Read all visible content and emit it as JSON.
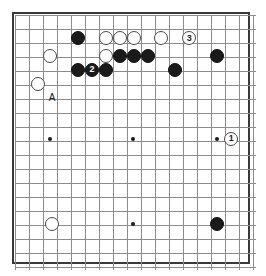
{
  "diagram": {
    "board": {
      "columns": 18,
      "rows": 19,
      "cell_size": 14,
      "origin_x": 15,
      "origin_y": 15,
      "line_color": "#8c8c8c",
      "border_color": "#3a3a3a",
      "background_color": "#ffffff"
    },
    "star_points": [
      {
        "name": "star-point-left",
        "col": 2.5,
        "row": 8.85
      },
      {
        "name": "star-point-center-upper",
        "col": 8.45,
        "row": 8.85
      },
      {
        "name": "star-point-right",
        "col": 14.45,
        "row": 8.85
      },
      {
        "name": "star-point-center-lower",
        "col": 8.45,
        "row": 14.9
      }
    ],
    "stone_radius": 7,
    "stones": [
      {
        "id": "b1",
        "color": "black",
        "label": "",
        "col": 4.5,
        "row": 1.65
      },
      {
        "id": "w1",
        "color": "white",
        "label": "",
        "col": 6.5,
        "row": 1.65
      },
      {
        "id": "w2",
        "color": "white",
        "label": "",
        "col": 7.5,
        "row": 1.65
      },
      {
        "id": "w3",
        "color": "white",
        "label": "",
        "col": 8.5,
        "row": 1.65
      },
      {
        "id": "w4",
        "color": "white",
        "label": "",
        "col": 10.45,
        "row": 1.65
      },
      {
        "id": "w5",
        "color": "white",
        "label": "3",
        "col": 12.45,
        "row": 1.65
      },
      {
        "id": "w6",
        "color": "white",
        "label": "",
        "col": 2.5,
        "row": 2.9
      },
      {
        "id": "w7",
        "color": "white",
        "label": "",
        "col": 6.5,
        "row": 2.9
      },
      {
        "id": "b2",
        "color": "black",
        "label": "",
        "col": 7.5,
        "row": 2.9
      },
      {
        "id": "b3",
        "color": "black",
        "label": "",
        "col": 8.5,
        "row": 2.9
      },
      {
        "id": "b4",
        "color": "black",
        "label": "",
        "col": 9.5,
        "row": 2.9
      },
      {
        "id": "b5",
        "color": "black",
        "label": "",
        "col": 14.45,
        "row": 2.9
      },
      {
        "id": "b6",
        "color": "black",
        "label": "",
        "col": 4.5,
        "row": 3.9
      },
      {
        "id": "b7",
        "color": "black",
        "label": "2",
        "col": 5.5,
        "row": 3.9
      },
      {
        "id": "b8",
        "color": "black",
        "label": "",
        "col": 6.5,
        "row": 3.9
      },
      {
        "id": "b9",
        "color": "black",
        "label": "",
        "col": 11.45,
        "row": 3.9
      },
      {
        "id": "w8",
        "color": "white",
        "label": "",
        "col": 1.65,
        "row": 4.9
      },
      {
        "id": "w9",
        "color": "white",
        "label": "1",
        "col": 15.45,
        "row": 8.85
      },
      {
        "id": "w10",
        "color": "white",
        "label": "",
        "col": 2.65,
        "row": 14.9
      },
      {
        "id": "b10",
        "color": "black",
        "label": "",
        "col": 14.45,
        "row": 14.9
      }
    ],
    "point_labels": [
      {
        "id": "a",
        "text": "A",
        "col": 2.65,
        "row": 5.9
      }
    ]
  }
}
